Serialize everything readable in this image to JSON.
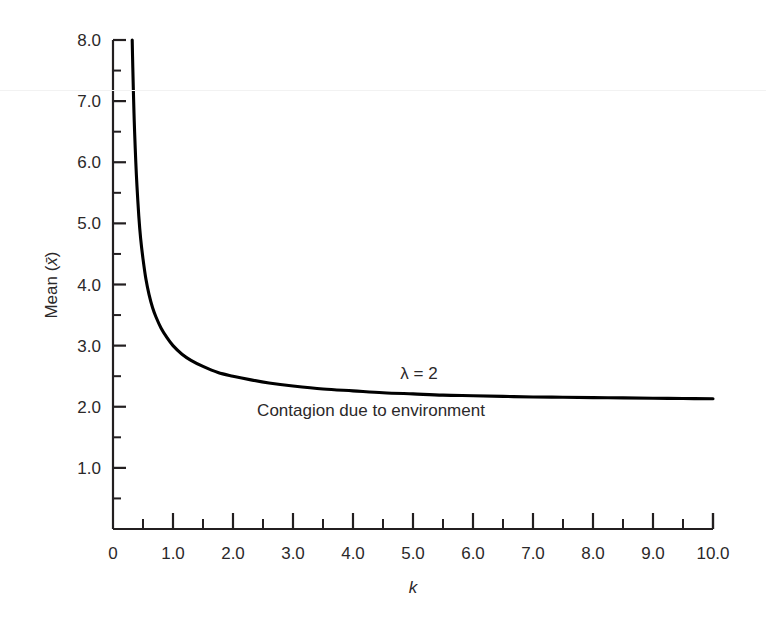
{
  "figure": {
    "background_color": "#ffffff",
    "ink_color": "#231f20",
    "curve_color": "#000000"
  },
  "chart_data": {
    "type": "line",
    "title": "",
    "subtitle": "",
    "xlabel": "k",
    "ylabel": "Mean (x̄)",
    "xlim": [
      0,
      10.0
    ],
    "ylim": [
      0,
      8.0
    ],
    "grid": false,
    "legend_position": "none",
    "x_ticks_major": [
      "0",
      "1.0",
      "2.0",
      "3.0",
      "4.0",
      "5.0",
      "6.0",
      "7.0",
      "8.0",
      "9.0",
      "10.0"
    ],
    "x_tick_values": [
      0,
      1,
      2,
      3,
      4,
      5,
      6,
      7,
      8,
      9,
      10
    ],
    "x_minor_tick_values": [
      0.5,
      1.5,
      2.5,
      3.5,
      4.5,
      5.5,
      6.5,
      7.5,
      8.5,
      9.5
    ],
    "y_ticks_major": [
      "1.0",
      "2.0",
      "3.0",
      "4.0",
      "5.0",
      "6.0",
      "7.0",
      "8.0"
    ],
    "y_tick_values": [
      1,
      2,
      3,
      4,
      5,
      6,
      7,
      8
    ],
    "y_minor_tick_values": [
      0.5,
      1.5,
      2.5,
      3.5,
      4.5,
      5.5,
      6.5,
      7.5
    ],
    "annotations": [
      {
        "name": "lambda-annotation",
        "text": "λ = 2",
        "x": 5.1,
        "y": 2.45
      },
      {
        "name": "contagion-annotation",
        "text": "Contagion due to environment",
        "x": 4.3,
        "y": 1.85
      }
    ],
    "series": [
      {
        "name": "mean-vs-k",
        "label": "",
        "color": "#000000",
        "x": [
          0.32,
          0.33,
          0.34,
          0.35,
          0.36,
          0.38,
          0.4,
          0.43,
          0.46,
          0.5,
          0.55,
          0.6,
          0.66,
          0.72,
          0.8,
          0.9,
          1.0,
          1.15,
          1.3,
          1.5,
          1.75,
          2.0,
          2.3,
          2.6,
          3.0,
          3.5,
          4.0,
          4.5,
          5.0,
          5.5,
          6.0,
          6.5,
          7.0,
          7.5,
          8.0,
          8.5,
          9.0,
          9.5,
          10.0
        ],
        "y": [
          8.0,
          7.55,
          7.15,
          6.8,
          6.5,
          6.0,
          5.6,
          5.12,
          4.76,
          4.42,
          4.08,
          3.84,
          3.62,
          3.46,
          3.29,
          3.13,
          3.0,
          2.86,
          2.76,
          2.66,
          2.56,
          2.5,
          2.44,
          2.39,
          2.34,
          2.29,
          2.26,
          2.23,
          2.21,
          2.19,
          2.18,
          2.17,
          2.16,
          2.155,
          2.15,
          2.145,
          2.14,
          2.135,
          2.13
        ]
      }
    ]
  },
  "axes_geometry": {
    "plot_left_px": 113,
    "plot_right_px": 713,
    "plot_top_px": 40,
    "plot_bottom_px": 529
  }
}
